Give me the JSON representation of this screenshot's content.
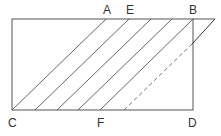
{
  "diagram": {
    "type": "geometry-figure",
    "colors": {
      "line": "#555555",
      "label": "#333333",
      "background": "#ffffff"
    },
    "labels": {
      "A": "A",
      "E": "E",
      "B": "B",
      "C": "C",
      "F": "F",
      "D": "D"
    },
    "points": {
      "C": [
        12,
        110
      ],
      "D": [
        193,
        110
      ],
      "A": [
        106,
        19
      ],
      "E": [
        129,
        19
      ],
      "B": [
        193,
        19
      ],
      "F": [
        100,
        110
      ]
    }
  }
}
